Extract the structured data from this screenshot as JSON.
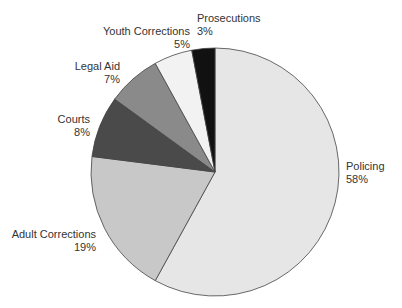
{
  "chart_data": {
    "type": "pie",
    "title": "",
    "slices": [
      {
        "label": "Policing",
        "value": 58,
        "pct_label": "58%",
        "color": "#e6e6e6"
      },
      {
        "label": "Adult Corrections",
        "value": 19,
        "pct_label": "19%",
        "color": "#c8c8c8"
      },
      {
        "label": "Courts",
        "value": 8,
        "pct_label": "8%",
        "color": "#4a4a4a"
      },
      {
        "label": "Legal Aid",
        "value": 7,
        "pct_label": "7%",
        "color": "#8a8a8a"
      },
      {
        "label": "Youth Corrections",
        "value": 5,
        "pct_label": "5%",
        "color": "#f2f2f2"
      },
      {
        "label": "Prosecutions",
        "value": 3,
        "pct_label": "3%",
        "color": "#111111"
      }
    ],
    "start_angle_deg": 0,
    "direction": "clockwise"
  }
}
